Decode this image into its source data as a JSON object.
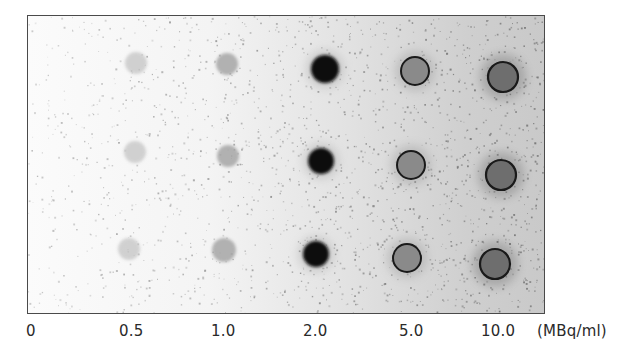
{
  "figure": {
    "type": "dot-blot autoradiograph",
    "rows": 3,
    "unit_label": "(MBq/ml)",
    "concentrations": [
      {
        "label": "0",
        "value": 0,
        "intensity": "none"
      },
      {
        "label": "0.5",
        "value": 0.5,
        "intensity": "faint"
      },
      {
        "label": "1.0",
        "value": 1.0,
        "intensity": "light"
      },
      {
        "label": "2.0",
        "value": 2.0,
        "intensity": "dark"
      },
      {
        "label": "5.0",
        "value": 5.0,
        "intensity": "ring"
      },
      {
        "label": "10.0",
        "value": 10.0,
        "intensity": "ring-saturated"
      }
    ],
    "spots": [
      [
        {
          "col": "0.5",
          "cx": 135,
          "cy": 62,
          "r": 11
        },
        {
          "col": "1.0",
          "cx": 226,
          "cy": 63,
          "r": 11
        },
        {
          "col": "2.0",
          "cx": 324,
          "cy": 68,
          "r": 14
        },
        {
          "col": "5.0",
          "cx": 414,
          "cy": 70,
          "r": 14
        },
        {
          "col": "10.0",
          "cx": 502,
          "cy": 76,
          "r": 15
        }
      ],
      [
        {
          "col": "0.5",
          "cx": 134,
          "cy": 151,
          "r": 11
        },
        {
          "col": "1.0",
          "cx": 227,
          "cy": 155,
          "r": 11
        },
        {
          "col": "2.0",
          "cx": 320,
          "cy": 160,
          "r": 13
        },
        {
          "col": "5.0",
          "cx": 410,
          "cy": 164,
          "r": 14
        },
        {
          "col": "10.0",
          "cx": 500,
          "cy": 174,
          "r": 15
        }
      ],
      [
        {
          "col": "0.5",
          "cx": 128,
          "cy": 248,
          "r": 11
        },
        {
          "col": "1.0",
          "cx": 223,
          "cy": 249,
          "r": 12
        },
        {
          "col": "2.0",
          "cx": 315,
          "cy": 253,
          "r": 13
        },
        {
          "col": "5.0",
          "cx": 406,
          "cy": 257,
          "r": 14
        },
        {
          "col": "10.0",
          "cx": 494,
          "cy": 263,
          "r": 15
        }
      ]
    ]
  },
  "colors": {
    "frame": "#4a4a4a",
    "faint": "#c4c4c4",
    "light": "#a6a6a6",
    "dark": "#111111",
    "ring_fill": "#8a8a8a",
    "ring_stroke": "#1a1a1a",
    "saturated_fill": "#6e6e6e",
    "label": "#2a2a2a"
  }
}
